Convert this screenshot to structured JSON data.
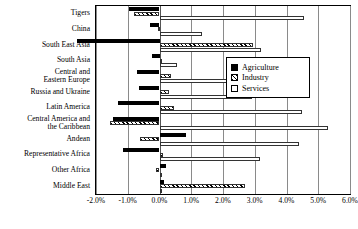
{
  "chart_data": {
    "type": "bar",
    "orientation": "horizontal",
    "title": "",
    "xlabel": "",
    "ylabel": "",
    "xlim": [
      -0.02,
      0.06
    ],
    "xlim_percent": [
      -2.0,
      6.0
    ],
    "grid": true,
    "legend_position": "right-middle",
    "xticks": [
      "-2.0%",
      "-1.0%",
      "0.0%",
      "1.0%",
      "2.0%",
      "3.0%",
      "4.0%",
      "5.0%",
      "6.0%"
    ],
    "xtick_values": [
      -2.0,
      -1.0,
      0.0,
      1.0,
      2.0,
      3.0,
      4.0,
      5.0,
      6.0
    ],
    "categories": [
      "Tigers",
      "China",
      "South East Asia",
      "South Asia",
      "Central and Eastern Europe",
      "Russia and Ukraine",
      "Latin America",
      "Central America and the Caribbean",
      "Andean",
      "Representative Africa",
      "Other Africa",
      "Middle East"
    ],
    "category_labels": [
      {
        "line1": "Tigers",
        "line2": ""
      },
      {
        "line1": "China",
        "line2": ""
      },
      {
        "line1": "South East Asia",
        "line2": ""
      },
      {
        "line1": "South Asia",
        "line2": ""
      },
      {
        "line1": "Central and",
        "line2": "Eastern Europe"
      },
      {
        "line1": "Russia and Ukraine",
        "line2": ""
      },
      {
        "line1": "Latin America",
        "line2": ""
      },
      {
        "line1": "Central America and",
        "line2": "the Caribbean"
      },
      {
        "line1": "Andean",
        "line2": ""
      },
      {
        "line1": "Representative Africa",
        "line2": ""
      },
      {
        "line1": "Other Africa",
        "line2": ""
      },
      {
        "line1": "Middle East",
        "line2": ""
      }
    ],
    "series": [
      {
        "name": "Agriculture",
        "pattern": "solid-black",
        "color": "#000000",
        "values": [
          -0.95,
          -0.3,
          -2.6,
          -0.25,
          -0.7,
          -0.65,
          -1.3,
          -1.45,
          0.85,
          -1.15,
          0.2,
          0.15
        ]
      },
      {
        "name": "Industry",
        "pattern": "hatched",
        "color": "#ffffff",
        "values": [
          -0.8,
          -0.05,
          2.95,
          0.03,
          0.35,
          0.3,
          0.45,
          -1.55,
          -0.6,
          0.1,
          -0.1,
          2.7
        ]
      },
      {
        "name": "Services",
        "pattern": "white",
        "color": "#ffffff",
        "values": [
          4.55,
          1.35,
          3.2,
          0.55,
          2.7,
          2.9,
          4.5,
          5.3,
          4.4,
          3.15,
          0.05,
          0.05
        ]
      }
    ]
  },
  "legend": {
    "items": [
      {
        "label": "Agriculture",
        "swatch": "solid-black-swatch"
      },
      {
        "label": "Industry",
        "swatch": "hatched-swatch"
      },
      {
        "label": "Services",
        "swatch": "white-swatch"
      }
    ]
  }
}
